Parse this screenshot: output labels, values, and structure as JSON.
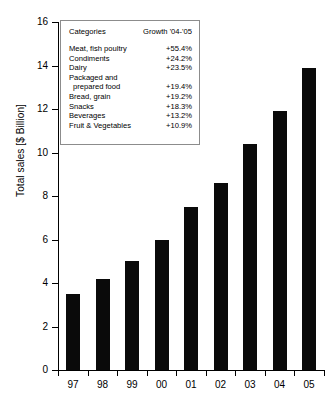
{
  "chart_data": {
    "type": "bar",
    "title": "",
    "xlabel": "",
    "ylabel": "Total sales [$ Billion]",
    "categories": [
      "97",
      "98",
      "99",
      "00",
      "01",
      "02",
      "03",
      "04",
      "05"
    ],
    "values": [
      3.5,
      4.2,
      5.0,
      6.0,
      7.5,
      8.6,
      10.4,
      11.9,
      13.9
    ],
    "ylim": [
      0,
      16
    ],
    "yticks": [
      0,
      2,
      4,
      6,
      8,
      10,
      12,
      14,
      16
    ],
    "ytick_labels": [
      "0",
      "2",
      "4",
      "6",
      "8",
      "10",
      "12",
      "14",
      "16"
    ],
    "grid": false,
    "legend_position": "upper-left-inset",
    "bar_color": "#0a0a0a",
    "background_color": "#ffffff"
  },
  "legend": {
    "header": {
      "categories_label": "Categories",
      "growth_label": "Growth '04-'05"
    },
    "rows": [
      {
        "category": "Meat, fish poultry",
        "growth": "+55.4%",
        "indent": false,
        "hide_value": false
      },
      {
        "category": "Condiments",
        "growth": "+24.2%",
        "indent": false,
        "hide_value": false
      },
      {
        "category": "Dairy",
        "growth": "+23.5%",
        "indent": false,
        "hide_value": false
      },
      {
        "category": "Packaged and",
        "growth": "",
        "indent": false,
        "hide_value": true
      },
      {
        "category": "prepared food",
        "growth": "+19.4%",
        "indent": true,
        "hide_value": false
      },
      {
        "category": "Bread, grain",
        "growth": "+19.2%",
        "indent": false,
        "hide_value": false
      },
      {
        "category": "Snacks",
        "growth": "+18.3%",
        "indent": false,
        "hide_value": false
      },
      {
        "category": "Beverages",
        "growth": "+13.2%",
        "indent": false,
        "hide_value": false
      },
      {
        "category": "Fruit & Vegetables",
        "growth": "+10.9%",
        "indent": false,
        "hide_value": false
      }
    ]
  }
}
